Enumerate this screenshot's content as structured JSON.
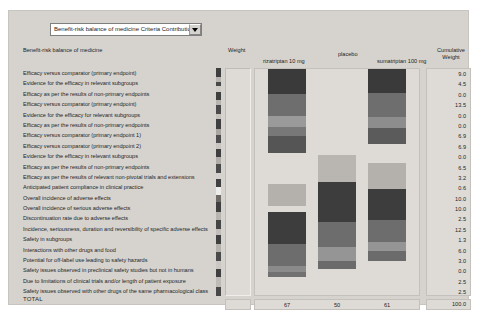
{
  "window": {
    "background": "#d6d3ce"
  },
  "dropdown": {
    "value": "Benefit-risk balance of medicine Criteria Contribution",
    "arrow_icon": "chevron-down-icon"
  },
  "headers": {
    "left_title": "Benefit-risk balance of medicine",
    "weight": "Weight",
    "cumulative_line1": "Cumulative",
    "cumulative_line2": "Weight",
    "bar1": "rizatriptan 10 mg",
    "bar2": "placebo",
    "bar3": "sumatriptan 100 mg"
  },
  "total_label": "TOTAL",
  "criteria": [
    "Efficacy versus comparator (primary endpoint)",
    "Evidence for the efficacy in relevant subgroups",
    "Efficacy as per the results of non-primary endpoints",
    "Efficacy versus comparator (primary endpoint)",
    "Evidence for the efficacy for relevant subgroups",
    "Efficacy as per the results of non-primary endpoints",
    "Efficacy versus comparator (primary endpoint 1)",
    "Efficacy versus comparator (primary endpoint 2)",
    "Evidence for the efficacy in relevant subgroups",
    "Efficacy as per the results of non-primary endpoints",
    "Efficacy as per the results of relevant non-pivotal trials and extensions",
    "Anticipated patient compliance in clinical practice",
    "Overall incidence of adverse effects",
    "Overall incidence of serious adverse effects",
    "Discontinuation rate due to adverse effects",
    "Incidence, seriousness, duration and reversibility of specific adverse effects",
    "Safety in subgroups",
    "Interactions with other drugs and food",
    "Potential for off-label use leading to safety hazards",
    "Safety issues observed in preclinical safety studies but not in humans",
    "Due to limitations of clinical trials and/or length of patient exposure",
    "Safety issues observed with other drugs of the same pharmacological class"
  ],
  "cumulative_weight": [
    "9.0",
    "4.5",
    "0.0",
    "13.5",
    "0.0",
    "0.0",
    "6.9",
    "6.9",
    "0.0",
    "6.5",
    "3.2",
    "0.6",
    "10.0",
    "10.0",
    "2.5",
    "12.5",
    "1.3",
    "6.0",
    "3.0",
    "0.0",
    "2.5",
    "2.5"
  ],
  "cumulative_total": "100.0",
  "bar_totals": {
    "bar1": "67",
    "bar2": "50",
    "bar3": "61"
  },
  "chart_data": {
    "type": "bar",
    "title": "Benefit-risk balance of medicine Criteria Contribution",
    "xlabel": "",
    "ylabel": "Weight",
    "categories": [
      "rizatriptan 10 mg",
      "placebo",
      "sumatriptan 100 mg"
    ],
    "values": [
      67,
      50,
      61
    ],
    "ylim": [
      0,
      100
    ],
    "grid": false,
    "legend": "none",
    "stacked": true,
    "criteria_weights": {
      "labels": [
        "Efficacy versus comparator (primary endpoint)",
        "Evidence for the efficacy in relevant subgroups",
        "Efficacy as per the results of non-primary endpoints",
        "Efficacy versus comparator (primary endpoint)",
        "Evidence for the efficacy for relevant subgroups",
        "Efficacy as per the results of non-primary endpoints",
        "Efficacy versus comparator (primary endpoint 1)",
        "Efficacy versus comparator (primary endpoint 2)",
        "Evidence for the efficacy in relevant subgroups",
        "Efficacy as per the results of non-primary endpoints",
        "Efficacy as per the results of relevant non-pivotal trials and extensions",
        "Anticipated patient compliance in clinical practice",
        "Overall incidence of adverse effects",
        "Overall incidence of serious adverse effects",
        "Discontinuation rate due to adverse effects",
        "Incidence, seriousness, duration and reversibility of specific adverse effects",
        "Safety in subgroups",
        "Interactions with other drugs and food",
        "Potential for off-label use leading to safety hazards",
        "Safety issues observed in preclinical safety studies but not in humans",
        "Due to limitations of clinical trials and/or length of patient exposure",
        "Safety issues observed with other drugs of the same pharmacological class"
      ],
      "values": [
        9.0,
        4.5,
        0.0,
        13.5,
        0.0,
        0.0,
        6.9,
        6.9,
        0.0,
        6.5,
        3.2,
        0.6,
        10.0,
        10.0,
        2.5,
        12.5,
        1.3,
        6.0,
        3.0,
        0.0,
        2.5,
        2.5
      ],
      "total": 100.0
    },
    "stacks": {
      "bar1": [
        {
          "h": 25,
          "color": "#3a3a3a"
        },
        {
          "h": 22,
          "color": "#6e6e6e"
        },
        {
          "h": 11,
          "color": "#9a9a9a"
        },
        {
          "h": 9,
          "color": "#787878"
        },
        {
          "h": 17,
          "color": "#555555"
        },
        {
          "h": 31,
          "color": "#dedbd6"
        },
        {
          "h": 22,
          "color": "#b4b1ac"
        },
        {
          "h": 6,
          "color": "#dedbd6"
        },
        {
          "h": 32,
          "color": "#3d3d3d"
        },
        {
          "h": 22,
          "color": "#6d6d6d"
        },
        {
          "h": 6,
          "color": "#8b8b8b"
        },
        {
          "h": 5,
          "color": "#717171"
        }
      ],
      "bar2": [
        {
          "h": 86,
          "color": "#dedbd6"
        },
        {
          "h": 27,
          "color": "#b9b6b1"
        },
        {
          "h": 40,
          "color": "#3d3d3d"
        },
        {
          "h": 25,
          "color": "#6d6d6d"
        },
        {
          "h": 14,
          "color": "#959595"
        },
        {
          "h": 8,
          "color": "#6b6b6b"
        }
      ],
      "bar3": [
        {
          "h": 24,
          "color": "#3a3a3a"
        },
        {
          "h": 24,
          "color": "#6e6e6e"
        },
        {
          "h": 11,
          "color": "#8d8d8d"
        },
        {
          "h": 16,
          "color": "#5b5b5b"
        },
        {
          "h": 19,
          "color": "#dedbd6"
        },
        {
          "h": 26,
          "color": "#b4b1ac"
        },
        {
          "h": 31,
          "color": "#3d3d3d"
        },
        {
          "h": 22,
          "color": "#6d6d6d"
        },
        {
          "h": 9,
          "color": "#959595"
        },
        {
          "h": 10,
          "color": "#6b6b6b"
        }
      ]
    },
    "weight_strip": [
      {
        "h": 9,
        "color": "#3f3f3f"
      },
      {
        "h": 5,
        "color": "#b8b5b0"
      },
      {
        "h": 4,
        "color": "#494949"
      },
      {
        "h": 6,
        "color": "#cfccc7"
      },
      {
        "h": 9,
        "color": "#3f3f3f"
      },
      {
        "h": 5,
        "color": "#b8b5b0"
      },
      {
        "h": 9,
        "color": "#4a4a4a"
      },
      {
        "h": 5,
        "color": "#c5c2bd"
      },
      {
        "h": 10,
        "color": "#3f3f3f"
      },
      {
        "h": 6,
        "color": "#a9a6a1"
      },
      {
        "h": 9,
        "color": "#4d4d4d"
      },
      {
        "h": 6,
        "color": "#c9c6c1"
      },
      {
        "h": 8,
        "color": "#3f3f3f"
      },
      {
        "h": 7,
        "color": "#b0ada8"
      },
      {
        "h": 9,
        "color": "#4a4a4a"
      },
      {
        "h": 6,
        "color": "#d4d1cc"
      },
      {
        "h": 9,
        "color": "#3f3f3f"
      },
      {
        "h": 8,
        "color": "#ececea"
      },
      {
        "h": 7,
        "color": "#6d6a65"
      },
      {
        "h": 10,
        "color": "#3f3f3f"
      },
      {
        "h": 8,
        "color": "#b8b5b0"
      },
      {
        "h": 9,
        "color": "#454545"
      },
      {
        "h": 7,
        "color": "#c2bfba"
      },
      {
        "h": 9,
        "color": "#3f3f3f"
      },
      {
        "h": 8,
        "color": "#b5b2ad"
      },
      {
        "h": 9,
        "color": "#4a4a4a"
      },
      {
        "h": 8,
        "color": "#cbc8c3"
      },
      {
        "h": 9,
        "color": "#3f3f3f"
      },
      {
        "h": 10,
        "color": "#bebbb6"
      },
      {
        "h": 9,
        "color": "#484848"
      }
    ]
  }
}
